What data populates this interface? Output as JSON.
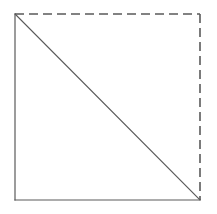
{
  "figure": {
    "canvas": {
      "width": 217,
      "height": 214,
      "background_color": "#ffffff"
    },
    "square": {
      "left": 15,
      "top": 14,
      "right": 200,
      "bottom": 200,
      "width": 185,
      "height": 186
    },
    "style": {
      "stroke_color": "#5a5a5a",
      "diagonal_color": "#5a5a5a",
      "stroke_width": 1.2,
      "dash_length": 9,
      "dash_gap": 5
    },
    "edges": [
      {
        "name": "left-edge",
        "line_style": "solid",
        "x1": 15,
        "y1": 14,
        "x2": 15,
        "y2": 200
      },
      {
        "name": "bottom-edge",
        "line_style": "solid",
        "x1": 15,
        "y1": 200,
        "x2": 200,
        "y2": 200
      },
      {
        "name": "top-edge",
        "line_style": "dashed",
        "x1": 15,
        "y1": 14,
        "x2": 200,
        "y2": 14
      },
      {
        "name": "right-edge",
        "line_style": "dashed",
        "x1": 200,
        "y1": 14,
        "x2": 200,
        "y2": 200
      }
    ],
    "diagonal": {
      "name": "diagonal",
      "line_style": "solid",
      "from": "top-left-corner",
      "to": "bottom-right-corner",
      "x1": 15,
      "y1": 14,
      "x2": 200,
      "y2": 200
    },
    "vertices": [
      {
        "name": "top-left-corner",
        "x": 15,
        "y": 14
      },
      {
        "name": "top-right-corner",
        "x": 200,
        "y": 14
      },
      {
        "name": "bottom-right-corner",
        "x": 200,
        "y": 200
      },
      {
        "name": "bottom-left-corner",
        "x": 15,
        "y": 200
      }
    ]
  }
}
